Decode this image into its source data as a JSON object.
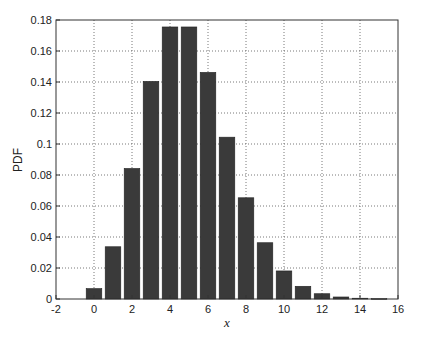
{
  "chart_data": {
    "type": "bar",
    "title": "",
    "xlabel": "x",
    "ylabel": "PDF",
    "x": [
      0,
      1,
      2,
      3,
      4,
      5,
      6,
      7,
      8,
      9,
      10,
      11,
      12,
      13,
      14,
      15
    ],
    "values": [
      0.0067,
      0.0337,
      0.0842,
      0.1404,
      0.1755,
      0.1755,
      0.1462,
      0.1044,
      0.0653,
      0.0363,
      0.0181,
      0.0082,
      0.0034,
      0.0013,
      0.0005,
      0.0002
    ],
    "xlim": [
      -2,
      16
    ],
    "ylim": [
      0,
      0.18
    ],
    "xticks": [
      "-2",
      "0",
      "2",
      "4",
      "6",
      "8",
      "10",
      "12",
      "14",
      "16"
    ],
    "yticks": [
      "0",
      "0.02",
      "0.04",
      "0.06",
      "0.08",
      "0.1",
      "0.12",
      "0.14",
      "0.16",
      "0.18"
    ],
    "grid": true,
    "grid_style": "dotted",
    "bar_color": "#3a3a3a",
    "legend": null
  }
}
